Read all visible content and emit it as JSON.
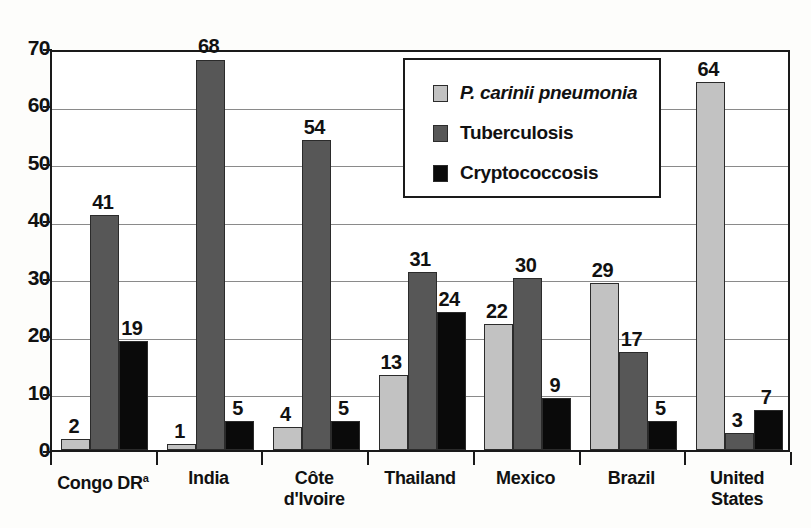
{
  "chart_data": {
    "type": "bar",
    "title": "",
    "xlabel": "",
    "ylabel": "",
    "ylim": [
      0,
      70
    ],
    "yticks": [
      0,
      10,
      20,
      30,
      40,
      50,
      60,
      70
    ],
    "grid": true,
    "legend_position": "inside-top-right",
    "categories": [
      "Congo DR",
      "India",
      "Côte d'Ivoire",
      "Thailand",
      "Mexico",
      "Brazil",
      "United States"
    ],
    "category_lines": [
      [
        "Congo DR"
      ],
      [
        "India"
      ],
      [
        "Côte",
        "d'Ivoire"
      ],
      [
        "Thailand"
      ],
      [
        "Mexico"
      ],
      [
        "Brazil"
      ],
      [
        "United",
        "States"
      ]
    ],
    "category_footnotes": [
      "a",
      "",
      "",
      "",
      "",
      "",
      ""
    ],
    "series": [
      {
        "name": "P. carinii pneumonia",
        "italic": true,
        "color": "#c2c2c2",
        "values": [
          2,
          1,
          4,
          13,
          22,
          29,
          64
        ]
      },
      {
        "name": "Tuberculosis",
        "italic": false,
        "color": "#575757",
        "values": [
          41,
          68,
          54,
          31,
          30,
          17,
          3
        ]
      },
      {
        "name": "Cryptococcosis",
        "italic": false,
        "color": "#0a0a0a",
        "values": [
          19,
          5,
          5,
          24,
          9,
          5,
          7
        ]
      }
    ]
  },
  "legend": {
    "entries": [
      {
        "label": "P. carinii pneumonia"
      },
      {
        "label": "Tuberculosis"
      },
      {
        "label": "Cryptococcosis"
      }
    ]
  },
  "axis": {
    "y_tick_labels": [
      "0",
      "10",
      "20",
      "30",
      "40",
      "50",
      "60",
      "70"
    ]
  }
}
